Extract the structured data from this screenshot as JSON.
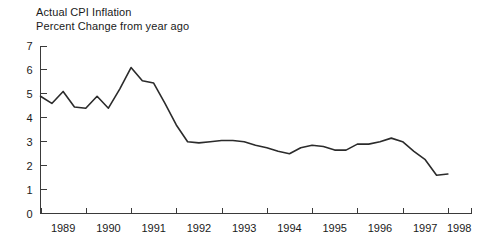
{
  "chart_data": {
    "type": "line",
    "title": "Actual CPI Inflation",
    "subtitle": "Percent Change from year ago",
    "xlabel": "",
    "ylabel": "",
    "ylim": [
      0,
      7
    ],
    "xlim": [
      1988.5,
      1998.0
    ],
    "yticks": [
      0,
      1,
      2,
      3,
      4,
      5,
      6,
      7
    ],
    "ytick_labels": [
      "0",
      "1",
      "2",
      "3",
      "4",
      "5",
      "6",
      "7"
    ],
    "xticks": [
      1988.5,
      1989.5,
      1990.5,
      1991.5,
      1992.5,
      1993.5,
      1994.5,
      1995.5,
      1996.5,
      1997.5,
      1998.0
    ],
    "xtick_labels": [
      "1989",
      "1990",
      "1991",
      "1992",
      "1993",
      "1994",
      "1995",
      "1996",
      "1997",
      "1998"
    ],
    "grid": false,
    "legend": "none",
    "series": [
      {
        "name": "Actual CPI Inflation",
        "color": "#2b2b2b",
        "x": [
          1988.5,
          1988.75,
          1989.0,
          1989.25,
          1989.5,
          1989.75,
          1990.0,
          1990.25,
          1990.5,
          1990.75,
          1991.0,
          1991.25,
          1991.5,
          1991.75,
          1992.0,
          1992.25,
          1992.5,
          1992.75,
          1993.0,
          1993.25,
          1993.5,
          1993.75,
          1994.0,
          1994.25,
          1994.5,
          1994.75,
          1995.0,
          1995.25,
          1995.5,
          1995.75,
          1996.0,
          1996.25,
          1996.5,
          1996.75,
          1997.0,
          1997.25,
          1997.5
        ],
        "y": [
          4.9,
          4.6,
          5.1,
          4.45,
          4.4,
          4.9,
          4.4,
          5.2,
          6.1,
          5.55,
          5.45,
          4.6,
          3.7,
          3.0,
          2.95,
          3.0,
          3.05,
          3.05,
          3.0,
          2.85,
          2.75,
          2.6,
          2.5,
          2.75,
          2.85,
          2.8,
          2.65,
          2.65,
          2.9,
          2.9,
          3.0,
          3.15,
          3.0,
          2.6,
          2.25,
          1.6,
          1.65
        ]
      }
    ]
  },
  "axes": {
    "y_axis_name": "percent-change",
    "x_axis_name": "year"
  }
}
